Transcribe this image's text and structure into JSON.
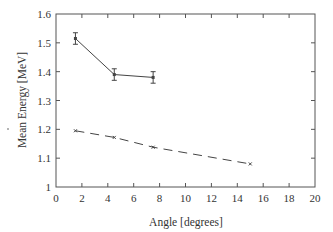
{
  "chart_data": {
    "type": "line",
    "title": "",
    "xlabel": "Angle [degrees]",
    "ylabel": "Mean Energy [MeV]",
    "xlim": [
      0,
      20
    ],
    "ylim": [
      1.0,
      1.6
    ],
    "xticks": [
      0,
      2,
      4,
      6,
      8,
      10,
      12,
      14,
      16,
      18,
      20
    ],
    "yticks": [
      1,
      1.1,
      1.2,
      1.3,
      1.4,
      1.5,
      1.6
    ],
    "ytick_labels": [
      "1",
      "1.1",
      "1.2",
      "1.3",
      "1.4",
      "1.5",
      "1.6"
    ],
    "grid": false,
    "legend": null,
    "series": [
      {
        "name": "solid-with-errorbars",
        "style": "solid",
        "marker": "square",
        "color": "#444444",
        "x": [
          1.5,
          4.5,
          7.5
        ],
        "y": [
          1.515,
          1.39,
          1.38
        ],
        "yerr": [
          0.02,
          0.02,
          0.02
        ]
      },
      {
        "name": "dashed",
        "style": "dashed",
        "marker": "cross",
        "color": "#444444",
        "x": [
          1.5,
          4.5,
          7.5,
          15
        ],
        "y": [
          1.195,
          1.172,
          1.138,
          1.08
        ]
      }
    ]
  }
}
